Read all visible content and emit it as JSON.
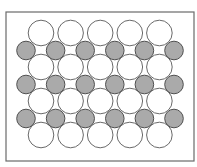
{
  "diagram": {
    "title": "",
    "frame": {
      "x": 6,
      "y": 12,
      "width": 188,
      "height": 149,
      "stroke": "#6a6a6a",
      "stroke_width": 1.2
    },
    "large_atoms": {
      "label": "large atom (white)",
      "fill": "#ffffff",
      "stroke": "#6a6a6a",
      "radius": 12.8,
      "columns_x": [
        41,
        70.6,
        100.2,
        129.8,
        159.4
      ],
      "rows_y": [
        33,
        67,
        101,
        135
      ]
    },
    "small_atoms": {
      "label": "small atom (gray)",
      "fill": "#aaaaaa",
      "stroke": "#505050",
      "radius": 9.3,
      "columns_x": [
        26,
        55.6,
        85.2,
        114.8,
        144.4,
        174
      ],
      "rows_y": [
        50.5,
        84.5,
        118.5
      ]
    },
    "counts": {
      "large_atoms": 20,
      "small_atoms": 18
    }
  }
}
